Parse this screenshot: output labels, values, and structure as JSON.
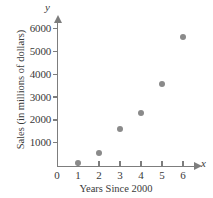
{
  "chart_data": {
    "type": "scatter",
    "title": "",
    "xlabel": "Years Since 2000",
    "ylabel": "Sales (in millions of dollars)",
    "x_axis_name": "x",
    "y_axis_name": "y",
    "x": [
      1,
      2,
      3,
      4,
      5,
      6
    ],
    "values": [
      100,
      550,
      1600,
      2320,
      3580,
      5650
    ],
    "categories": [
      "1",
      "2",
      "3",
      "4",
      "5",
      "6"
    ],
    "xticks": [
      "0",
      "1",
      "2",
      "3",
      "4",
      "5",
      "6"
    ],
    "yticks": [
      "1000",
      "2000",
      "3000",
      "4000",
      "5000",
      "6000"
    ],
    "xlim": [
      0,
      6.8
    ],
    "ylim": [
      0,
      6400
    ],
    "grid": false,
    "legend": "none",
    "marker_color": "#8a8a8a",
    "axis_color": "#7d7d7d"
  },
  "axis": {
    "y_ticks": [
      {
        "label": "6000",
        "value": 6000
      },
      {
        "label": "5000",
        "value": 5000
      },
      {
        "label": "4000",
        "value": 4000
      },
      {
        "label": "3000",
        "value": 3000
      },
      {
        "label": "2000",
        "value": 2000
      },
      {
        "label": "1000",
        "value": 1000
      }
    ],
    "x_ticks": [
      {
        "label": "0",
        "value": 0
      },
      {
        "label": "1",
        "value": 1
      },
      {
        "label": "2",
        "value": 2
      },
      {
        "label": "3",
        "value": 3
      },
      {
        "label": "4",
        "value": 4
      },
      {
        "label": "5",
        "value": 5
      },
      {
        "label": "6",
        "value": 6
      }
    ],
    "x_name": "x",
    "y_name": "y",
    "x_title": "Years Since 2000",
    "y_title": "Sales (in millions of dollars)"
  }
}
